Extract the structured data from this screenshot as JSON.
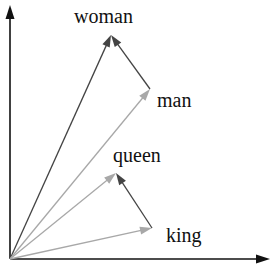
{
  "diagram": {
    "origin": [
      10,
      259
    ],
    "axes": {
      "x_end": [
        270,
        259
      ],
      "y_end": [
        10,
        5
      ],
      "color": "#111111"
    },
    "colors": {
      "dark": "#444444",
      "light": "#a8a8a8"
    },
    "points": {
      "woman": {
        "label": "woman",
        "pos": [
          111,
          35
        ],
        "label_pos": [
          74,
          6
        ]
      },
      "man": {
        "label": "man",
        "pos": [
          150,
          89
        ],
        "label_pos": [
          157,
          90
        ]
      },
      "queen": {
        "label": "queen",
        "pos": [
          116,
          173
        ],
        "label_pos": [
          113,
          145
        ]
      },
      "king": {
        "label": "king",
        "pos": [
          152,
          228
        ],
        "label_pos": [
          166,
          225
        ]
      }
    },
    "arrows": [
      {
        "name": "origin-to-woman",
        "from": "origin",
        "to": "woman",
        "shade": "dark"
      },
      {
        "name": "origin-to-man",
        "from": "origin",
        "to": "man",
        "shade": "light"
      },
      {
        "name": "man-to-woman",
        "from": "man",
        "to": "woman",
        "shade": "dark"
      },
      {
        "name": "origin-to-queen",
        "from": "origin",
        "to": "queen",
        "shade": "light"
      },
      {
        "name": "origin-to-king",
        "from": "origin",
        "to": "king",
        "shade": "light"
      },
      {
        "name": "king-to-queen",
        "from": "king",
        "to": "queen",
        "shade": "dark"
      }
    ]
  },
  "labels": {
    "woman": "woman",
    "man": "man",
    "queen": "queen",
    "king": "king"
  }
}
